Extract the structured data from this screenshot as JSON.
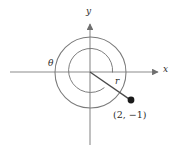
{
  "figure": {
    "kind": "unit-circle-diagram",
    "background_color": "#ffffff",
    "stroke_color": "#6f6f6f",
    "text_color": "#2b2b2b",
    "point_color": "#1a1a1a",
    "axes": {
      "x_label": "x",
      "y_label": "y",
      "origin": {
        "x": 90,
        "y": 72
      },
      "x_axis": {
        "x1": 10,
        "y1": 72,
        "x2": 160,
        "y2": 72,
        "arrow": "right"
      },
      "y_axis": {
        "x1": 90,
        "y1": 145,
        "x2": 90,
        "y2": 22,
        "arrow": "up"
      }
    },
    "circle": {
      "cx": 90.5,
      "cy": 72.5,
      "r": 35.5
    },
    "angle": {
      "symbol": "θ",
      "arc_radius": 22,
      "description": "angle measured from positive x-axis counterclockwise to terminal ray"
    },
    "radius_segment": {
      "label": "r",
      "from": {
        "x": 90,
        "y": 72
      },
      "to": {
        "x": 131,
        "y": 100
      }
    },
    "point": {
      "label": "(2, −1)",
      "x_coord": 2,
      "y_coord": -1,
      "pixel": {
        "x": 131,
        "y": 100
      },
      "dot_radius": 3.4
    }
  }
}
